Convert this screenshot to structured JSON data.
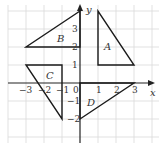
{
  "diagram": {
    "type": "coordinate-grid",
    "origin_px": [
      80,
      83
    ],
    "unit_px": 18,
    "grid": {
      "xmin": -4,
      "xmax": 4,
      "ymin": -3,
      "ymax": 4
    },
    "axes": {
      "x_label": "x",
      "y_label": "y"
    },
    "x_ticks": [
      {
        "value": -3,
        "label": "-3"
      },
      {
        "value": -2,
        "label": "-2"
      },
      {
        "value": -1,
        "label": "-1"
      },
      {
        "value": 1,
        "label": "1"
      },
      {
        "value": 2,
        "label": "2"
      },
      {
        "value": 3,
        "label": "3"
      }
    ],
    "y_ticks": [
      {
        "value": 3,
        "label": "3"
      },
      {
        "value": 2,
        "label": "2"
      },
      {
        "value": 1,
        "label": "1"
      },
      {
        "value": -1,
        "label": "-1"
      },
      {
        "value": -2,
        "label": "-2"
      }
    ],
    "origin_label": "0",
    "shapes": [
      {
        "label": "A",
        "vertices": [
          [
            1,
            4
          ],
          [
            1,
            1
          ],
          [
            3,
            1
          ]
        ]
      },
      {
        "label": "B",
        "vertices": [
          [
            0,
            4
          ],
          [
            -3,
            2
          ],
          [
            0,
            2
          ]
        ]
      },
      {
        "label": "C",
        "vertices": [
          [
            -3,
            1
          ],
          [
            -1,
            1
          ],
          [
            -1,
            -2
          ]
        ]
      },
      {
        "label": "D",
        "vertices": [
          [
            0,
            -2
          ],
          [
            3,
            0
          ],
          [
            0,
            0
          ]
        ]
      }
    ],
    "colors": {
      "grid": "#d9d9d9",
      "axis": "#222222",
      "shape": "#1a1a1a"
    }
  }
}
